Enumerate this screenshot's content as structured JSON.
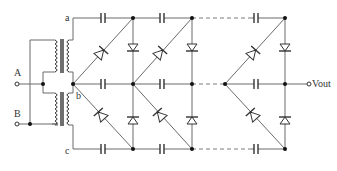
{
  "diagram": {
    "type": "voltage multiplier circuit (Cockcroft-Walton style, dual transformer)",
    "labels": {
      "input_a": "A",
      "input_b": "B",
      "rail_a": "a",
      "rail_b": "b",
      "rail_c": "c",
      "output": "Vout"
    },
    "components": {
      "transformers": 2,
      "capacitors_per_rail": "3 (repeating stages, dashed continuation)",
      "diodes_per_stage": 4
    },
    "colors": {
      "wire": "#6a6a6a",
      "component": "#333333",
      "background": "#ffffff"
    }
  }
}
